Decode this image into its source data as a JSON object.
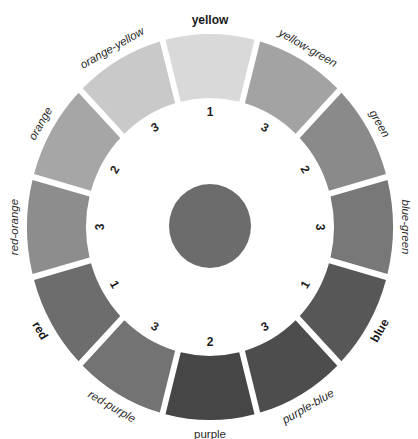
{
  "chart_data": {
    "type": "diagram",
    "title": "",
    "geometry": {
      "cx": 210,
      "cy": 227,
      "outer_rx": 183,
      "outer_ry": 193,
      "inner_rx": 124,
      "inner_ry": 129,
      "gap_px": 6,
      "center_rx": 41,
      "center_ry": 42,
      "center_color": "#6c6c6c",
      "label_rx": 196,
      "label_ry": 207,
      "number_rx": 110,
      "number_ry": 115
    },
    "segments": [
      {
        "name": "yellow",
        "number": "1",
        "color": "#d9d9d9",
        "style": "primary"
      },
      {
        "name": "yellow-green",
        "number": "3",
        "color": "#a3a3a3",
        "style": "italic"
      },
      {
        "name": "green",
        "number": "2",
        "color": "#8a8a8a",
        "style": "italic"
      },
      {
        "name": "blue-green",
        "number": "3",
        "color": "#787878",
        "style": "italic"
      },
      {
        "name": "blue",
        "number": "1",
        "color": "#575757",
        "style": "primary"
      },
      {
        "name": "purple-blue",
        "number": "3",
        "color": "#4d4d4d",
        "style": "italic"
      },
      {
        "name": "purple",
        "number": "2",
        "color": "#464646",
        "style": "upright"
      },
      {
        "name": "red-purple",
        "number": "3",
        "color": "#737373",
        "style": "italic"
      },
      {
        "name": "red",
        "number": "1",
        "color": "#6d6d6d",
        "style": "primary"
      },
      {
        "name": "red-orange",
        "number": "3",
        "color": "#8d8d8d",
        "style": "italic"
      },
      {
        "name": "orange",
        "number": "2",
        "color": "#a6a6a6",
        "style": "italic"
      },
      {
        "name": "orange-yellow",
        "number": "3",
        "color": "#c9c9c9",
        "style": "italic"
      }
    ]
  }
}
